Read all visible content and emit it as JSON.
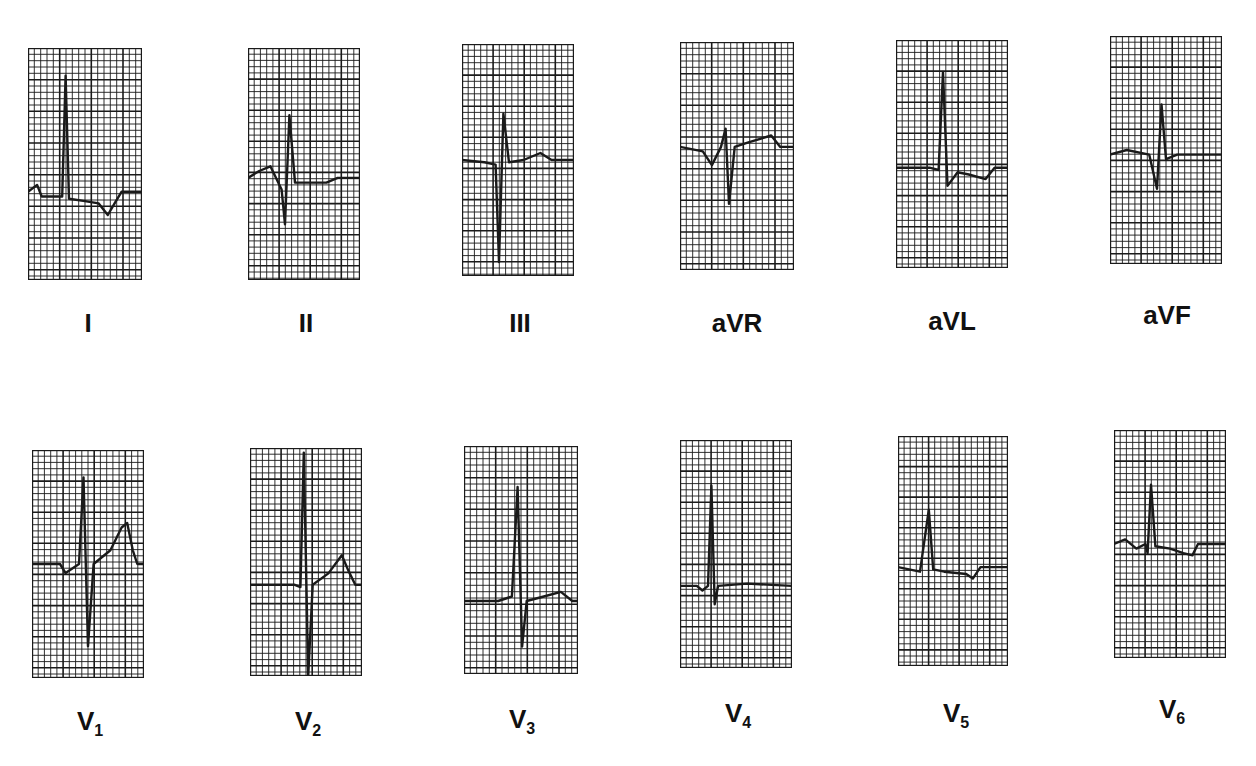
{
  "grid": {
    "line_color": "#1a1a1a",
    "trace_color": "#1a1a1a",
    "background": "#ffffff"
  },
  "leads": [
    {
      "id": "I",
      "label": "I",
      "sub": "",
      "x": 28,
      "y": 48,
      "w": 114,
      "h": 232,
      "baseline": 0.62,
      "trace": [
        [
          0,
          0
        ],
        [
          0.08,
          -0.03
        ],
        [
          0.12,
          0.02
        ],
        [
          0.3,
          0.02
        ],
        [
          0.33,
          -0.5
        ],
        [
          0.36,
          0.03
        ],
        [
          0.5,
          0.04
        ],
        [
          0.62,
          0.05
        ],
        [
          0.7,
          0.1
        ],
        [
          0.76,
          0.05
        ],
        [
          0.82,
          0
        ],
        [
          1,
          0
        ]
      ]
    },
    {
      "id": "II",
      "label": "II",
      "sub": "",
      "x": 248,
      "y": 48,
      "w": 112,
      "h": 232,
      "baseline": 0.56,
      "trace": [
        [
          0,
          0
        ],
        [
          0.1,
          -0.03
        ],
        [
          0.2,
          -0.05
        ],
        [
          0.3,
          0.05
        ],
        [
          0.33,
          0.2
        ],
        [
          0.37,
          -0.27
        ],
        [
          0.42,
          0.02
        ],
        [
          0.5,
          0.02
        ],
        [
          0.7,
          0.02
        ],
        [
          0.8,
          0
        ],
        [
          1,
          0
        ]
      ]
    },
    {
      "id": "III",
      "label": "III",
      "sub": "",
      "x": 462,
      "y": 44,
      "w": 112,
      "h": 232,
      "baseline": 0.5,
      "trace": [
        [
          0,
          0
        ],
        [
          0.2,
          0.01
        ],
        [
          0.3,
          0.02
        ],
        [
          0.33,
          0.44
        ],
        [
          0.37,
          -0.2
        ],
        [
          0.42,
          0.01
        ],
        [
          0.55,
          0
        ],
        [
          0.7,
          -0.03
        ],
        [
          0.8,
          0
        ],
        [
          1,
          0
        ]
      ]
    },
    {
      "id": "aVR",
      "label": "aVR",
      "sub": "",
      "x": 680,
      "y": 42,
      "w": 114,
      "h": 228,
      "baseline": 0.46,
      "trace": [
        [
          0,
          0
        ],
        [
          0.2,
          0.02
        ],
        [
          0.28,
          0.08
        ],
        [
          0.36,
          0
        ],
        [
          0.4,
          -0.08
        ],
        [
          0.43,
          0.25
        ],
        [
          0.48,
          0
        ],
        [
          0.6,
          -0.02
        ],
        [
          0.8,
          -0.05
        ],
        [
          0.88,
          0
        ],
        [
          1,
          0
        ]
      ]
    },
    {
      "id": "aVL",
      "label": "aVL",
      "sub": "",
      "x": 896,
      "y": 40,
      "w": 112,
      "h": 228,
      "baseline": 0.56,
      "trace": [
        [
          0,
          0
        ],
        [
          0.3,
          0
        ],
        [
          0.38,
          0.01
        ],
        [
          0.42,
          -0.42
        ],
        [
          0.46,
          0.08
        ],
        [
          0.55,
          0.02
        ],
        [
          0.65,
          0.03
        ],
        [
          0.8,
          0.05
        ],
        [
          0.88,
          0
        ],
        [
          1,
          0
        ]
      ]
    },
    {
      "id": "aVF",
      "label": "aVF",
      "sub": "",
      "x": 1110,
      "y": 36,
      "w": 112,
      "h": 228,
      "baseline": 0.52,
      "trace": [
        [
          0,
          0
        ],
        [
          0.15,
          -0.02
        ],
        [
          0.35,
          0
        ],
        [
          0.42,
          0.15
        ],
        [
          0.46,
          -0.22
        ],
        [
          0.5,
          0.02
        ],
        [
          0.6,
          0
        ],
        [
          1,
          0
        ]
      ]
    },
    {
      "id": "V1",
      "label": "V",
      "sub": "1",
      "x": 32,
      "y": 450,
      "w": 112,
      "h": 228,
      "baseline": 0.5,
      "trace": [
        [
          0,
          0
        ],
        [
          0.25,
          0
        ],
        [
          0.3,
          0.04
        ],
        [
          0.42,
          0
        ],
        [
          0.46,
          -0.38
        ],
        [
          0.5,
          0.36
        ],
        [
          0.55,
          0
        ],
        [
          0.7,
          -0.06
        ],
        [
          0.8,
          -0.16
        ],
        [
          0.85,
          -0.18
        ],
        [
          0.9,
          -0.06
        ],
        [
          0.94,
          0
        ],
        [
          1,
          0
        ]
      ]
    },
    {
      "id": "V2",
      "label": "V",
      "sub": "2",
      "x": 250,
      "y": 448,
      "w": 112,
      "h": 228,
      "baseline": 0.6,
      "trace": [
        [
          0,
          0
        ],
        [
          0.25,
          0
        ],
        [
          0.4,
          0
        ],
        [
          0.45,
          0.01
        ],
        [
          0.48,
          -0.58
        ],
        [
          0.52,
          0.4
        ],
        [
          0.56,
          0
        ],
        [
          0.7,
          -0.05
        ],
        [
          0.82,
          -0.13
        ],
        [
          0.88,
          -0.06
        ],
        [
          0.94,
          0
        ],
        [
          1,
          0
        ]
      ]
    },
    {
      "id": "V3",
      "label": "V",
      "sub": "3",
      "x": 464,
      "y": 446,
      "w": 114,
      "h": 228,
      "baseline": 0.68,
      "trace": [
        [
          0,
          0
        ],
        [
          0.3,
          0
        ],
        [
          0.42,
          -0.02
        ],
        [
          0.47,
          -0.5
        ],
        [
          0.51,
          0.2
        ],
        [
          0.55,
          0
        ],
        [
          0.7,
          -0.02
        ],
        [
          0.85,
          -0.04
        ],
        [
          0.95,
          0
        ],
        [
          1,
          0
        ]
      ]
    },
    {
      "id": "V4",
      "label": "V",
      "sub": "4",
      "x": 680,
      "y": 440,
      "w": 112,
      "h": 228,
      "baseline": 0.64,
      "trace": [
        [
          0,
          0
        ],
        [
          0.15,
          0
        ],
        [
          0.2,
          0.02
        ],
        [
          0.25,
          0
        ],
        [
          0.28,
          -0.44
        ],
        [
          0.31,
          0.08
        ],
        [
          0.34,
          0
        ],
        [
          0.6,
          -0.01
        ],
        [
          1,
          0
        ]
      ]
    },
    {
      "id": "V5",
      "label": "V",
      "sub": "5",
      "x": 898,
      "y": 436,
      "w": 110,
      "h": 230,
      "baseline": 0.57,
      "trace": [
        [
          0,
          0
        ],
        [
          0.2,
          0.02
        ],
        [
          0.28,
          -0.25
        ],
        [
          0.32,
          0.01
        ],
        [
          0.42,
          0.02
        ],
        [
          0.62,
          0.03
        ],
        [
          0.68,
          0.05
        ],
        [
          0.75,
          0
        ],
        [
          1,
          0
        ]
      ]
    },
    {
      "id": "V6",
      "label": "V",
      "sub": "6",
      "x": 1114,
      "y": 430,
      "w": 112,
      "h": 228,
      "baseline": 0.5,
      "trace": [
        [
          0,
          0
        ],
        [
          0.1,
          -0.02
        ],
        [
          0.2,
          0.02
        ],
        [
          0.28,
          0
        ],
        [
          0.3,
          0.04
        ],
        [
          0.33,
          -0.26
        ],
        [
          0.37,
          0.01
        ],
        [
          0.5,
          0.02
        ],
        [
          0.62,
          0.04
        ],
        [
          0.7,
          0.05
        ],
        [
          0.75,
          0
        ],
        [
          1,
          0
        ]
      ]
    }
  ],
  "labels": [
    {
      "text": "I",
      "sub": "",
      "cx": 88,
      "y": 308
    },
    {
      "text": "II",
      "sub": "",
      "cx": 306,
      "y": 308
    },
    {
      "text": "III",
      "sub": "",
      "cx": 520,
      "y": 308
    },
    {
      "text": "aVR",
      "sub": "",
      "cx": 737,
      "y": 308
    },
    {
      "text": "aVL",
      "sub": "",
      "cx": 952,
      "y": 306
    },
    {
      "text": "aVF",
      "sub": "",
      "cx": 1167,
      "y": 300
    },
    {
      "text": "V",
      "sub": "1",
      "cx": 90,
      "y": 706
    },
    {
      "text": "V",
      "sub": "2",
      "cx": 308,
      "y": 706
    },
    {
      "text": "V",
      "sub": "3",
      "cx": 522,
      "y": 704
    },
    {
      "text": "V",
      "sub": "4",
      "cx": 738,
      "y": 698
    },
    {
      "text": "V",
      "sub": "5",
      "cx": 956,
      "y": 698
    },
    {
      "text": "V",
      "sub": "6",
      "cx": 1172,
      "y": 694
    }
  ]
}
